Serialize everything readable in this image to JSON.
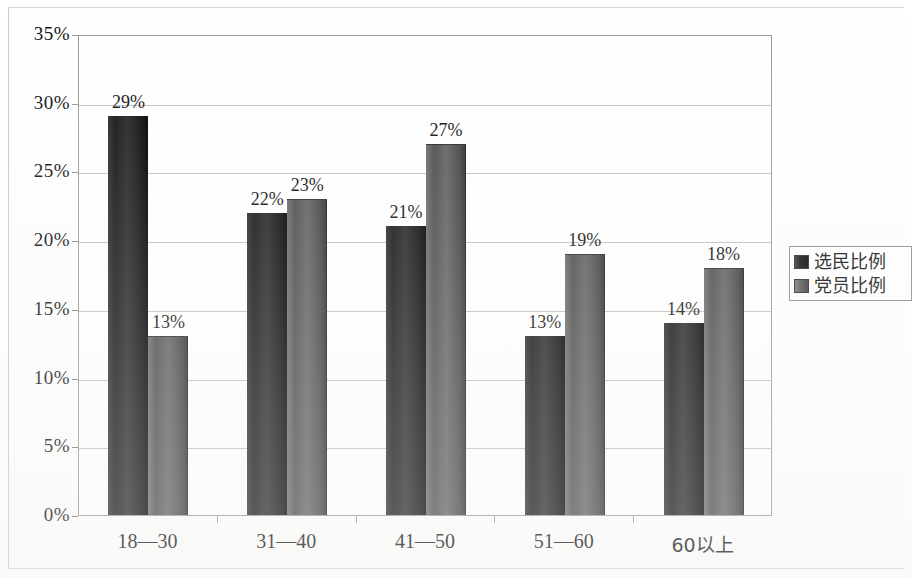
{
  "chart_data": {
    "type": "bar",
    "title": "",
    "subtitle": "",
    "xlabel": "",
    "ylabel": "",
    "categories": [
      "18—30",
      "31—40",
      "41—50",
      "51—60",
      "60以上"
    ],
    "series": [
      {
        "name": "选民比例",
        "color": "#1e1e1e",
        "values": [
          29,
          22,
          21,
          13,
          14
        ],
        "labels": [
          "29%",
          "22%",
          "21%",
          "13%",
          "14%"
        ]
      },
      {
        "name": "党员比例",
        "color": "#575757",
        "values": [
          13,
          23,
          27,
          19,
          18
        ],
        "labels": [
          "13%",
          "23%",
          "27%",
          "19%",
          "18%"
        ]
      }
    ],
    "ylim": [
      0,
      35
    ],
    "ytick_values": [
      0,
      5,
      10,
      15,
      20,
      25,
      30,
      35
    ],
    "ytick_labels": [
      "0%",
      "5%",
      "10%",
      "15%",
      "20%",
      "25%",
      "30%",
      "35%"
    ],
    "grid": true,
    "grid_axis": "y",
    "legend_position": "right",
    "data_labels": true,
    "value_suffix": "%"
  },
  "legend": {
    "entries": [
      {
        "label": "选民比例",
        "swatch": "series-0"
      },
      {
        "label": "党员比例",
        "swatch": "series-1"
      }
    ]
  },
  "colors": {
    "series_0": "#1e1e1e",
    "series_1": "#575757",
    "gridline": "#c2c2c2",
    "axis": "#9a9a9a",
    "text": "#111111",
    "background": "#ffffff"
  }
}
